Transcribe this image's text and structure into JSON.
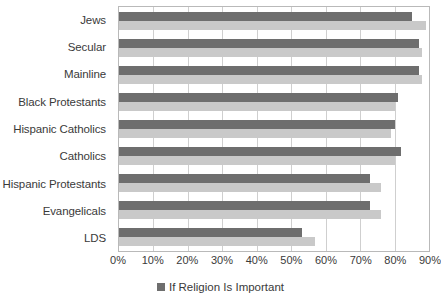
{
  "chart_data": {
    "type": "bar",
    "orientation": "horizontal",
    "title": "",
    "subtitle": "",
    "xlabel": "",
    "ylabel": "",
    "categories": [
      "Jews",
      "Secular",
      "Mainline",
      "Black Protestants",
      "Hispanic Catholics",
      "Catholics",
      "Hispanic Protestants",
      "Evangelicals",
      "LDS"
    ],
    "series": [
      {
        "name": "If Religion Is Important",
        "color": "#6e6e6e",
        "values": [
          85,
          87,
          87,
          81,
          80,
          82,
          73,
          73,
          53
        ]
      },
      {
        "name": "",
        "color": "#c9c9c9",
        "values": [
          89,
          88,
          88,
          80,
          79,
          80,
          76,
          76,
          57
        ]
      }
    ],
    "xlim": [
      0,
      90
    ],
    "xticks": [
      0,
      10,
      20,
      30,
      40,
      50,
      60,
      70,
      80,
      90
    ],
    "xtick_labels": [
      "0%",
      "10%",
      "20%",
      "30%",
      "40%",
      "50%",
      "60%",
      "70%",
      "80%",
      "90%"
    ],
    "grid": true,
    "grid_axis": "x",
    "legend_position": "bottom",
    "legend_entries": [
      {
        "label": "If Religion Is Important",
        "color": "#6e6e6e"
      }
    ],
    "plot_border_color": "#b9b9b9",
    "gridline_color": "#cfcfcf",
    "background_color": "#ffffff",
    "text_color": "#3a3a3a"
  }
}
